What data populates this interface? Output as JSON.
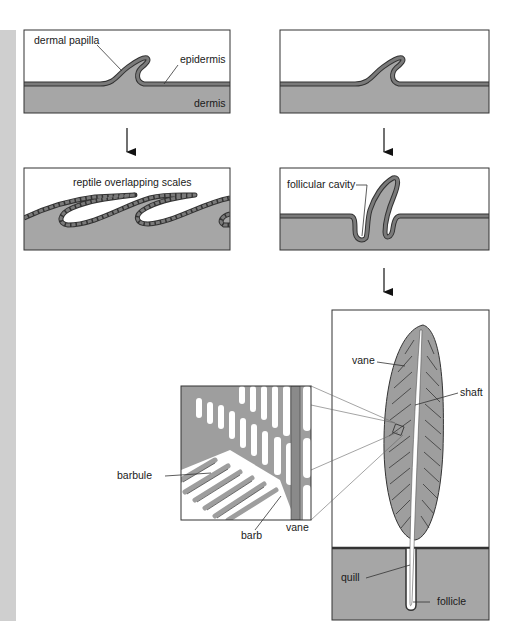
{
  "figure": {
    "colors": {
      "dermis": "#a6a6a6",
      "epidermis_fill": "#7a7a7a",
      "outline": "#333333",
      "background": "#ffffff",
      "sidebar": "#cfcfcf",
      "feather_vane": "#9e9e9e"
    },
    "panels": [
      {
        "id": "panel-1",
        "labels": {
          "dermal_papilla": "dermal papilla",
          "epidermis": "epidermis",
          "dermis": "dermis"
        }
      },
      {
        "id": "panel-2",
        "labels": {}
      },
      {
        "id": "panel-3",
        "labels": {
          "title": "reptile overlapping scales"
        }
      },
      {
        "id": "panel-4",
        "labels": {
          "follicular_cavity": "follicular cavity"
        }
      },
      {
        "id": "panel-5",
        "labels": {
          "vane": "vane",
          "shaft": "shaft",
          "quill": "quill",
          "follicle": "follicle"
        }
      }
    ],
    "inset": {
      "labels": {
        "barbule": "barbule",
        "barb": "barb",
        "vane": "vane"
      }
    },
    "arrows": [
      {
        "from": "panel-1",
        "to": "panel-3"
      },
      {
        "from": "panel-2",
        "to": "panel-4"
      },
      {
        "from": "panel-4",
        "to": "panel-5"
      }
    ]
  }
}
